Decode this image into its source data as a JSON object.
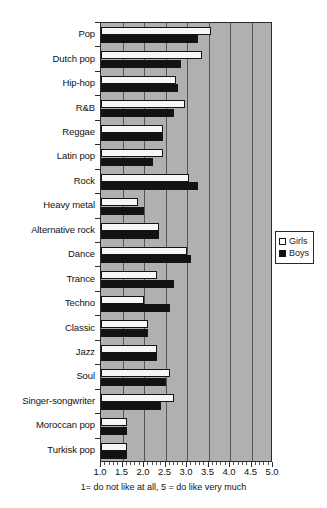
{
  "chart_data": {
    "type": "bar",
    "orientation": "horizontal",
    "title": "",
    "xlabel": "1= do not like at all, 5 = do like very much",
    "ylabel": "",
    "xlim": [
      1.0,
      5.0
    ],
    "xticks": [
      "1.0",
      "1.5",
      "2.0",
      "2.5",
      "3.0",
      "3.5",
      "4.0",
      "4.5",
      "5.0"
    ],
    "grid": true,
    "legend_position": "right",
    "categories": [
      "Pop",
      "Dutch pop",
      "Hip-hop",
      "R&B",
      "Reggae",
      "Latin pop",
      "Rock",
      "Heavy metal",
      "Alternative rock",
      "Dance",
      "Trance",
      "Techno",
      "Classic",
      "Jazz",
      "Soul",
      "Singer-songwriter",
      "Moroccan pop",
      "Turkisk pop"
    ],
    "series": [
      {
        "name": "Girls",
        "color": "#f7f7f7",
        "values": [
          3.55,
          3.35,
          2.75,
          2.95,
          2.45,
          2.45,
          3.05,
          1.85,
          2.35,
          3.0,
          2.3,
          2.0,
          2.1,
          2.3,
          2.6,
          2.7,
          1.6,
          1.6
        ]
      },
      {
        "name": "Boys",
        "color": "#121212",
        "values": [
          3.25,
          2.85,
          2.8,
          2.7,
          2.45,
          2.2,
          3.25,
          2.0,
          2.35,
          3.1,
          2.7,
          2.6,
          2.1,
          2.3,
          2.5,
          2.4,
          1.6,
          1.6
        ]
      }
    ]
  },
  "legend": {
    "items": [
      {
        "label": "Girls",
        "swatch": "girls"
      },
      {
        "label": "Boys",
        "swatch": "boys"
      }
    ]
  },
  "caption": "1= do not like at all, 5 = do like very much"
}
